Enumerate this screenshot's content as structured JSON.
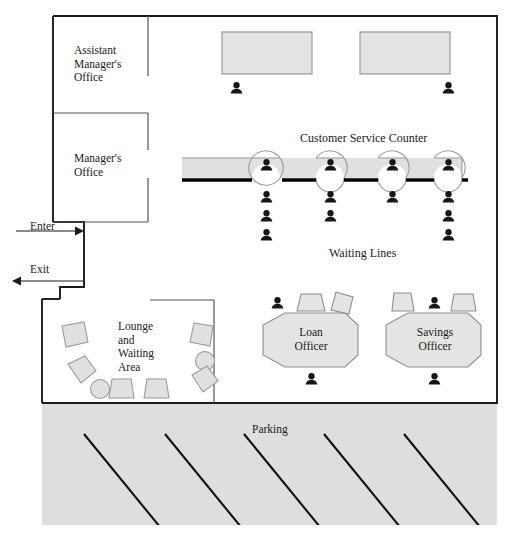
{
  "diagram": {
    "type": "floor-plan",
    "canvas": {
      "width": 509,
      "height": 537
    }
  },
  "colors": {
    "wall": "#1a1a1a",
    "interior_wall": "#555555",
    "furniture_fill": "#e2e2e2",
    "furniture_stroke": "#999999",
    "counter_fill": "#e0e0e0",
    "counter_edge": "#000000",
    "person": "#161616",
    "parking_fill": "#dedede",
    "parking_stripe": "#111111",
    "background": "#ffffff",
    "text": "#1a1a1a"
  },
  "rooms": [
    {
      "id": "assistant-managers-office",
      "label": "Assistant\nManager's\nOffice",
      "x": 74,
      "y": 44
    },
    {
      "id": "managers-office",
      "label": "Manager's\nOffice",
      "x": 74,
      "y": 152
    },
    {
      "id": "lounge-waiting-area",
      "label": "Lounge\nand\nWaiting\nArea",
      "x": 118,
      "y": 320
    }
  ],
  "labels": {
    "customer_service_counter": "Customer Service Counter",
    "waiting_lines": "Waiting Lines",
    "parking": "Parking",
    "enter": "Enter",
    "exit": "Exit"
  },
  "desks": [
    {
      "id": "back-desk-left",
      "label": "",
      "shape": "rect",
      "x": 222,
      "y": 32,
      "w": 90,
      "h": 42
    },
    {
      "id": "back-desk-right",
      "label": "",
      "shape": "rect",
      "x": 360,
      "y": 32,
      "w": 90,
      "h": 42
    },
    {
      "id": "loan-officer-desk",
      "label": "Loan\nOfficer",
      "shape": "hexagon",
      "cx": 311,
      "cy": 341
    },
    {
      "id": "savings-officer-desk",
      "label": "Savings\nOfficer",
      "shape": "hexagon",
      "cx": 434,
      "cy": 341
    }
  ],
  "counter": {
    "label": "Customer Service Counter",
    "x": 182,
    "y": 158,
    "w": 280,
    "h": 20,
    "teller_stations": 4,
    "teller_x": [
      266,
      330,
      392,
      448
    ]
  },
  "waiting_lines": {
    "label": "Waiting Lines",
    "lines": [
      {
        "id": "line-1",
        "x": 266,
        "people": 3
      },
      {
        "id": "line-2",
        "x": 330,
        "people": 2
      },
      {
        "id": "line-3",
        "x": 392,
        "people": 1
      },
      {
        "id": "line-4",
        "x": 448,
        "people": 3
      }
    ]
  },
  "people": [
    {
      "id": "person-back-desk-left",
      "x": 236,
      "y": 88
    },
    {
      "id": "person-back-desk-right",
      "x": 448,
      "y": 88
    },
    {
      "id": "person-teller-1",
      "x": 266,
      "y": 163
    },
    {
      "id": "person-teller-2",
      "x": 330,
      "y": 163
    },
    {
      "id": "person-teller-3",
      "x": 392,
      "y": 163
    },
    {
      "id": "person-teller-4",
      "x": 448,
      "y": 163
    },
    {
      "id": "person-queue-1a",
      "x": 266,
      "y": 196
    },
    {
      "id": "person-queue-1b",
      "x": 266,
      "y": 216
    },
    {
      "id": "person-queue-1c",
      "x": 266,
      "y": 235
    },
    {
      "id": "person-queue-2a",
      "x": 330,
      "y": 196
    },
    {
      "id": "person-queue-2b",
      "x": 330,
      "y": 216
    },
    {
      "id": "person-queue-3a",
      "x": 392,
      "y": 196
    },
    {
      "id": "person-queue-4a",
      "x": 448,
      "y": 196
    },
    {
      "id": "person-queue-4b",
      "x": 448,
      "y": 216
    },
    {
      "id": "person-queue-4c",
      "x": 448,
      "y": 235
    },
    {
      "id": "person-loan-client",
      "x": 277,
      "y": 303
    },
    {
      "id": "person-loan-officer",
      "x": 311,
      "y": 379
    },
    {
      "id": "person-savings-client",
      "x": 434,
      "y": 303
    },
    {
      "id": "person-savings-officer",
      "x": 434,
      "y": 379
    }
  ],
  "lounge_furniture": [
    {
      "id": "lounge-chair-1",
      "shape": "pentagon",
      "cx": 74,
      "cy": 334,
      "r": 14,
      "rot": -12
    },
    {
      "id": "lounge-chair-2",
      "shape": "pentagon",
      "cx": 80,
      "cy": 372,
      "r": 13,
      "rot": 20
    },
    {
      "id": "lounge-table-1",
      "shape": "circle",
      "cx": 100,
      "cy": 389,
      "r": 9
    },
    {
      "id": "lounge-chair-3",
      "shape": "trapezoid",
      "cx": 122,
      "cy": 389,
      "r": 12,
      "rot": 0
    },
    {
      "id": "lounge-chair-4",
      "shape": "trapezoid",
      "cx": 157,
      "cy": 389,
      "r": 12,
      "rot": 0
    },
    {
      "id": "lounge-chair-5",
      "shape": "pentagon",
      "cx": 203,
      "cy": 334,
      "r": 14,
      "rot": 10
    },
    {
      "id": "lounge-table-2",
      "shape": "circle",
      "cx": 205,
      "cy": 361,
      "r": 9
    },
    {
      "id": "lounge-chair-6",
      "shape": "pentagon",
      "cx": 201,
      "cy": 387,
      "r": 13,
      "rot": -20
    }
  ],
  "officer_chairs": [
    {
      "id": "loan-chair-1",
      "shape": "trapezoid",
      "cx": 311,
      "cy": 303,
      "r": 12,
      "rot": 0
    },
    {
      "id": "loan-chair-2",
      "shape": "pentagon",
      "cx": 345,
      "cy": 303,
      "r": 13,
      "rot": 25
    },
    {
      "id": "savings-chair-1",
      "shape": "pentagon",
      "cx": 402,
      "cy": 302,
      "r": 13,
      "rot": -8
    },
    {
      "id": "savings-chair-2",
      "shape": "trapezoid",
      "cx": 463,
      "cy": 303,
      "r": 12,
      "rot": 5
    }
  ],
  "doors": [
    {
      "id": "enter-arrow",
      "label": "Enter",
      "direction": "right",
      "y": 231,
      "x1": 16,
      "x2": 82,
      "label_x": 30,
      "label_y": 222
    },
    {
      "id": "exit-arrow",
      "label": "Exit",
      "direction": "left",
      "y": 281,
      "x1": 12,
      "x2": 84,
      "label_x": 30,
      "label_y": 264
    }
  ],
  "parking": {
    "label": "Parking",
    "x": 42,
    "y": 403,
    "w": 455,
    "h": 122,
    "stripe_count": 5,
    "stripe_x": [
      84,
      165,
      244,
      324,
      404
    ]
  }
}
